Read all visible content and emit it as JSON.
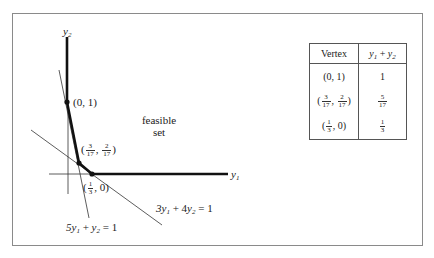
{
  "figure": {
    "axes": {
      "x_label_var": "y",
      "x_label_sub": "1",
      "y_label_var": "y",
      "y_label_sub": "2"
    },
    "region_label_line1": "feasible",
    "region_label_line2": "set",
    "constraints": [
      {
        "label_parts": {
          "a": "5y",
          "a_sub": "1",
          "op": " + ",
          "b": "y",
          "b_sub": "2",
          "rhs": " = 1"
        },
        "text": "5y1 + y2 = 1"
      },
      {
        "label_parts": {
          "a": "3y",
          "a_sub": "1",
          "op": " + 4",
          "b": "y",
          "b_sub": "2",
          "rhs": " = 1"
        },
        "text": "3y1 + 4y2 = 1"
      }
    ],
    "vertices": [
      {
        "text": "(0, 1)"
      },
      {
        "open": "(",
        "x_num": "3",
        "x_den": "17",
        "sep": ", ",
        "y_num": "2",
        "y_den": "17",
        "close": ")",
        "text": "(3/17, 2/17)"
      },
      {
        "open": "(",
        "x_num": "1",
        "x_den": "3",
        "rest": ", 0)",
        "text": "(1/3, 0)"
      }
    ]
  },
  "table": {
    "headers": {
      "vertex": "Vertex",
      "objective": {
        "a": "y",
        "a_sub": "1",
        "op": " + ",
        "b": "y",
        "b_sub": "2",
        "text": "y1 + y2"
      }
    },
    "rows": [
      {
        "vertex": "(0, 1)",
        "value": "1"
      },
      {
        "vertex": "(3/17, 2/17)",
        "vertex_parts": {
          "open": "(",
          "x_num": "3",
          "x_den": "17",
          "sep": ", ",
          "y_num": "2",
          "y_den": "17",
          "close": ")"
        },
        "value": "5/17",
        "value_num": "5",
        "value_den": "17"
      },
      {
        "vertex": "(1/3, 0)",
        "vertex_parts": {
          "open": "(",
          "x_num": "1",
          "x_den": "3",
          "rest": ", 0)"
        },
        "value": "1/3",
        "value_num": "1",
        "value_den": "3"
      }
    ]
  }
}
